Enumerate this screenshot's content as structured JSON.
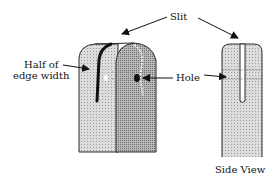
{
  "labels": {
    "slit": "Slit",
    "half_of_line1": "Half of",
    "half_of_line2": "edge width",
    "hole": "Hole",
    "side_view": "Side View"
  },
  "colors": {
    "light_face": "#d4d4d4",
    "dark_face": "#a9a9a9",
    "outline": "#2a2a2a",
    "slit": "#111111"
  }
}
